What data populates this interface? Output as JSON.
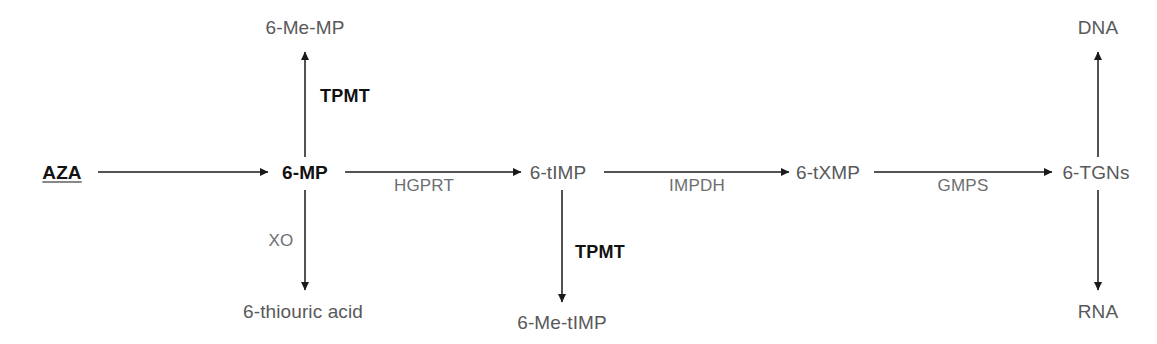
{
  "diagram": {
    "colors": {
      "background": "#ffffff",
      "arrow": "#1a1a1a",
      "metabolite_text": "#58595b",
      "metabolite_primary_text": "#121212",
      "enzyme_text": "#6d6e71",
      "enzyme_strong_text": "#111111"
    },
    "nodes": [
      {
        "id": "aza",
        "label": "AZA",
        "x": 62,
        "y": 172,
        "style": "primary-underlined"
      },
      {
        "id": "mp6",
        "label": "6-MP",
        "x": 305,
        "y": 172,
        "style": "primary"
      },
      {
        "id": "me_mp6",
        "label": "6-Me-MP",
        "x": 305,
        "y": 27,
        "style": "metabolite"
      },
      {
        "id": "thiouric",
        "label": "6-thiouric acid",
        "x": 303,
        "y": 311,
        "style": "metabolite"
      },
      {
        "id": "timp6",
        "label": "6-tIMP",
        "x": 558,
        "y": 172,
        "style": "metabolite"
      },
      {
        "id": "me_timp6",
        "label": "6-Me-tIMP",
        "x": 562,
        "y": 322,
        "style": "metabolite"
      },
      {
        "id": "txmp6",
        "label": "6-tXMP",
        "x": 828,
        "y": 172,
        "style": "metabolite"
      },
      {
        "id": "tgns6",
        "label": "6-TGNs",
        "x": 1096,
        "y": 172,
        "style": "metabolite"
      },
      {
        "id": "dna",
        "label": "DNA",
        "x": 1098,
        "y": 27,
        "style": "metabolite"
      },
      {
        "id": "rna",
        "label": "RNA",
        "x": 1098,
        "y": 311,
        "style": "metabolite"
      }
    ],
    "enzymes": [
      {
        "id": "tpmt_upper",
        "label": "TPMT",
        "x": 345,
        "y": 96,
        "style": "strong"
      },
      {
        "id": "xo",
        "label": "XO",
        "x": 281,
        "y": 240,
        "style": "normal"
      },
      {
        "id": "hgprt",
        "label": "HGPRT",
        "x": 424,
        "y": 185,
        "style": "normal"
      },
      {
        "id": "tpmt_lower",
        "label": "TPMT",
        "x": 600,
        "y": 252,
        "style": "strong"
      },
      {
        "id": "impdh",
        "label": "IMPDH",
        "x": 697,
        "y": 185,
        "style": "normal"
      },
      {
        "id": "gmps",
        "label": "GMPS",
        "x": 963,
        "y": 185,
        "style": "normal"
      }
    ],
    "arrows": [
      {
        "id": "aza-to-6mp",
        "from": "AZA",
        "to": "6-MP",
        "direction": "right"
      },
      {
        "id": "6mp-to-6memp",
        "from": "6-MP",
        "to": "6-Me-MP",
        "direction": "up"
      },
      {
        "id": "6mp-to-thiouric",
        "from": "6-MP",
        "to": "6-thiouric acid",
        "direction": "down"
      },
      {
        "id": "6mp-to-6timp",
        "from": "6-MP",
        "to": "6-tIMP",
        "direction": "right"
      },
      {
        "id": "6timp-to-6metimp",
        "from": "6-tIMP",
        "to": "6-Me-tIMP",
        "direction": "down"
      },
      {
        "id": "6timp-to-6txmp",
        "from": "6-tIMP",
        "to": "6-tXMP",
        "direction": "right"
      },
      {
        "id": "6txmp-to-6tgns",
        "from": "6-tXMP",
        "to": "6-TGNs",
        "direction": "right"
      },
      {
        "id": "6tgns-to-dna",
        "from": "6-TGNs",
        "to": "DNA",
        "direction": "up"
      },
      {
        "id": "6tgns-to-rna",
        "from": "6-TGNs",
        "to": "RNA",
        "direction": "down"
      }
    ]
  }
}
